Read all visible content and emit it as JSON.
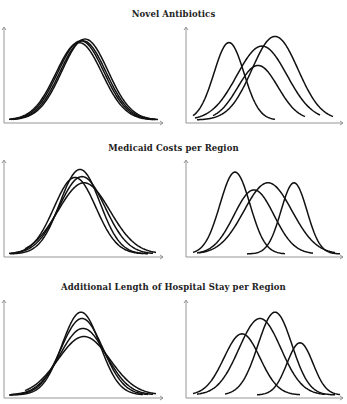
{
  "figure": {
    "sections": [
      {
        "title": "Novel Antibiotics",
        "title_y": 9,
        "panel_top": 27,
        "panel_bottom": 123
      },
      {
        "title": "Medicaid Costs per Region",
        "title_y": 143,
        "panel_top": 160,
        "panel_bottom": 257
      },
      {
        "title": "Additional Length of Hospital Stay per Region",
        "title_y": 282,
        "panel_top": 300,
        "panel_bottom": 398
      }
    ]
  },
  "chart_data": [
    {
      "type": "line",
      "title": "Novel Antibiotics",
      "panel": "left",
      "description": "Overlapping bell curves, nearly identical distributions",
      "xlabel": "",
      "ylabel": "",
      "grid": false,
      "legend": "none",
      "series": [
        {
          "name": "curve-1",
          "mean": 76,
          "sd": 23,
          "peak": 0.88,
          "x_start": 6,
          "x_end": 150
        },
        {
          "name": "curve-2",
          "mean": 78,
          "sd": 23,
          "peak": 0.9,
          "x_start": 7,
          "x_end": 152
        },
        {
          "name": "curve-3",
          "mean": 80,
          "sd": 23,
          "peak": 0.9,
          "x_start": 8,
          "x_end": 153
        },
        {
          "name": "curve-4",
          "mean": 82,
          "sd": 23,
          "peak": 0.92,
          "x_start": 10,
          "x_end": 155
        }
      ]
    },
    {
      "type": "line",
      "title": "Novel Antibiotics",
      "panel": "right",
      "description": "Four bell curves with different means and spreads",
      "xlabel": "",
      "ylabel": "",
      "grid": false,
      "legend": "none",
      "series": [
        {
          "name": "curve-1",
          "mean": 44,
          "sd": 15,
          "peak": 0.88,
          "x_start": 8,
          "x_end": 90
        },
        {
          "name": "curve-2",
          "mean": 77,
          "sd": 25,
          "peak": 0.84,
          "x_start": 10,
          "x_end": 135
        },
        {
          "name": "curve-3",
          "mean": 73,
          "sd": 20,
          "peak": 0.62,
          "x_start": 28,
          "x_end": 120
        },
        {
          "name": "curve-4",
          "mean": 90,
          "sd": 23,
          "peak": 0.95,
          "x_start": 12,
          "x_end": 148
        }
      ]
    },
    {
      "type": "line",
      "title": "Medicaid Costs per Region",
      "panel": "left",
      "description": "Overlapping bell curves with slightly different heights",
      "xlabel": "",
      "ylabel": "",
      "grid": false,
      "legend": "none",
      "series": [
        {
          "name": "curve-1",
          "mean": 72,
          "sd": 21,
          "peak": 0.86,
          "x_start": 6,
          "x_end": 140
        },
        {
          "name": "curve-2",
          "mean": 77,
          "sd": 20,
          "peak": 0.95,
          "x_start": 7,
          "x_end": 145
        },
        {
          "name": "curve-3",
          "mean": 79,
          "sd": 23,
          "peak": 0.87,
          "x_start": 8,
          "x_end": 150
        },
        {
          "name": "curve-4",
          "mean": 81,
          "sd": 26,
          "peak": 0.8,
          "x_start": 22,
          "x_end": 153
        }
      ]
    },
    {
      "type": "line",
      "title": "Medicaid Costs per Region",
      "panel": "right",
      "description": "Four bell curves spread across the range",
      "xlabel": "",
      "ylabel": "",
      "grid": false,
      "legend": "none",
      "series": [
        {
          "name": "curve-1",
          "mean": 50,
          "sd": 15,
          "peak": 0.92,
          "x_start": 8,
          "x_end": 100
        },
        {
          "name": "curve-2",
          "mean": 69,
          "sd": 20,
          "peak": 0.72,
          "x_start": 12,
          "x_end": 128
        },
        {
          "name": "curve-3",
          "mean": 83,
          "sd": 24,
          "peak": 0.8,
          "x_start": 14,
          "x_end": 150
        },
        {
          "name": "curve-4",
          "mean": 109,
          "sd": 13,
          "peak": 0.8,
          "x_start": 62,
          "x_end": 155
        }
      ]
    },
    {
      "type": "line",
      "title": "Additional Length of Hospital Stay per Region",
      "panel": "left",
      "description": "Bell curves sharing a mean with varying peak heights",
      "xlabel": "",
      "ylabel": "",
      "grid": false,
      "legend": "none",
      "series": [
        {
          "name": "curve-1",
          "mean": 78,
          "sd": 19,
          "peak": 0.92,
          "x_start": 6,
          "x_end": 140
        },
        {
          "name": "curve-2",
          "mean": 79,
          "sd": 21,
          "peak": 0.85,
          "x_start": 7,
          "x_end": 145
        },
        {
          "name": "curve-3",
          "mean": 80,
          "sd": 23,
          "peak": 0.74,
          "x_start": 8,
          "x_end": 150
        },
        {
          "name": "curve-4",
          "mean": 81,
          "sd": 26,
          "peak": 0.65,
          "x_start": 22,
          "x_end": 153
        }
      ]
    },
    {
      "type": "line",
      "title": "Additional Length of Hospital Stay per Region",
      "panel": "right",
      "description": "Four bell curves at increasing means",
      "xlabel": "",
      "ylabel": "",
      "grid": false,
      "legend": "none",
      "series": [
        {
          "name": "curve-1",
          "mean": 57,
          "sd": 18,
          "peak": 0.68,
          "x_start": 8,
          "x_end": 115
        },
        {
          "name": "curve-2",
          "mean": 75,
          "sd": 21,
          "peak": 0.85,
          "x_start": 12,
          "x_end": 140
        },
        {
          "name": "curve-3",
          "mean": 90,
          "sd": 17,
          "peak": 0.92,
          "x_start": 40,
          "x_end": 150
        },
        {
          "name": "curve-4",
          "mean": 115,
          "sd": 13,
          "peak": 0.58,
          "x_start": 72,
          "x_end": 155
        }
      ]
    }
  ]
}
